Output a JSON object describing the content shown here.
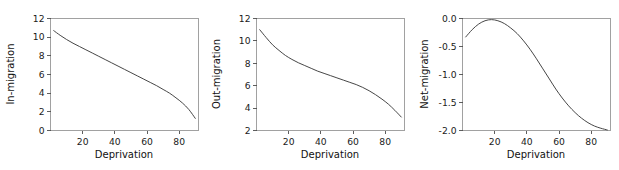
{
  "figure": {
    "background": "#ffffff",
    "line_color": "#3c3c3c",
    "axis_color": "#4d4d4d",
    "panel_count": 3
  },
  "chart_data": [
    {
      "type": "line",
      "title": "",
      "xlabel": "Deprivation",
      "ylabel": "In-migration",
      "xlim": [
        0,
        92
      ],
      "ylim": [
        0,
        12
      ],
      "xticks": [
        20,
        40,
        60,
        80
      ],
      "yticks": [
        0,
        2,
        4,
        6,
        8,
        10,
        12
      ],
      "xticklabels": [
        "20",
        "40",
        "60",
        "80"
      ],
      "yticklabels": [
        "0",
        "2",
        "4",
        "6",
        "8",
        "10",
        "12"
      ],
      "grid": false,
      "legend": "none",
      "series": [
        {
          "name": "In-migration",
          "x": [
            2,
            6,
            10,
            14,
            18,
            22,
            26,
            30,
            34,
            38,
            42,
            46,
            50,
            54,
            58,
            62,
            66,
            70,
            74,
            78,
            82,
            86,
            90
          ],
          "values": [
            10.7,
            10.2,
            9.75,
            9.35,
            9.0,
            8.65,
            8.3,
            7.95,
            7.6,
            7.25,
            6.9,
            6.55,
            6.2,
            5.85,
            5.5,
            5.15,
            4.8,
            4.4,
            4.0,
            3.5,
            2.95,
            2.25,
            1.3
          ]
        }
      ]
    },
    {
      "type": "line",
      "title": "",
      "xlabel": "Deprivation",
      "ylabel": "Out-migration",
      "xlim": [
        0,
        92
      ],
      "ylim": [
        2,
        12
      ],
      "xticks": [
        20,
        40,
        60,
        80
      ],
      "yticks": [
        2,
        4,
        6,
        8,
        10,
        12
      ],
      "xticklabels": [
        "20",
        "40",
        "60",
        "80"
      ],
      "yticklabels": [
        "2",
        "4",
        "6",
        "8",
        "10",
        "12"
      ],
      "grid": false,
      "legend": "none",
      "series": [
        {
          "name": "Out-migration",
          "x": [
            2,
            6,
            10,
            14,
            18,
            22,
            26,
            30,
            34,
            38,
            42,
            46,
            50,
            54,
            58,
            62,
            66,
            70,
            74,
            78,
            82,
            86,
            90
          ],
          "values": [
            11.0,
            10.3,
            9.65,
            9.15,
            8.7,
            8.35,
            8.05,
            7.8,
            7.55,
            7.3,
            7.1,
            6.9,
            6.7,
            6.5,
            6.3,
            6.1,
            5.85,
            5.55,
            5.2,
            4.8,
            4.35,
            3.8,
            3.2
          ]
        }
      ]
    },
    {
      "type": "line",
      "title": "",
      "xlabel": "Deprivation",
      "ylabel": "Net-migration",
      "xlim": [
        0,
        92
      ],
      "ylim": [
        -2.0,
        0.0
      ],
      "xticks": [
        20,
        40,
        60,
        80
      ],
      "yticks": [
        -2.0,
        -1.5,
        -1.0,
        -0.5,
        0.0
      ],
      "xticklabels": [
        "20",
        "40",
        "60",
        "80"
      ],
      "yticklabels": [
        "-2.0",
        "-1.5",
        "-1.0",
        "-0.5",
        "0.0"
      ],
      "grid": false,
      "legend": "none",
      "series": [
        {
          "name": "Net-migration",
          "x": [
            2,
            6,
            10,
            14,
            18,
            22,
            26,
            30,
            34,
            38,
            42,
            46,
            50,
            54,
            58,
            62,
            66,
            70,
            74,
            78,
            82,
            86,
            90
          ],
          "values": [
            -0.33,
            -0.2,
            -0.1,
            -0.04,
            -0.02,
            -0.04,
            -0.09,
            -0.17,
            -0.27,
            -0.4,
            -0.55,
            -0.72,
            -0.9,
            -1.08,
            -1.26,
            -1.42,
            -1.56,
            -1.68,
            -1.78,
            -1.86,
            -1.92,
            -1.96,
            -1.99
          ]
        }
      ]
    }
  ]
}
